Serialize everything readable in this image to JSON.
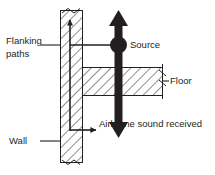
{
  "diagram": {
    "type": "architectural-section",
    "background_color": "#ffffff",
    "ink_color": "#231f20",
    "labels": {
      "flanking_paths_line1": "Flanking",
      "flanking_paths_line2": "paths",
      "source": "Source",
      "floor": "Floor",
      "airborne": "Airborne sound received",
      "wall": "Wall"
    },
    "elements": {
      "wall": {
        "name": "Wall",
        "hatch": "diagonal",
        "orientation": "vertical",
        "break_symbol_top": true,
        "break_symbol_bottom": true
      },
      "floor": {
        "name": "Floor",
        "hatch": "diagonal",
        "orientation": "horizontal",
        "break_symbol_right": true
      },
      "source": {
        "name": "Source",
        "marker": "filled-circle",
        "color": "#231f20"
      },
      "sound_arrow": {
        "name": "Airborne sound path",
        "style": "thick-double-headed-vertical-arrow",
        "color": "#231f20"
      },
      "flanking_arrow_vertical": {
        "name": "Flanking path in wall",
        "style": "thin-arrow-up",
        "color": "#231f20"
      },
      "flanking_arrow_horizontal": {
        "name": "Flanking path out of wall",
        "style": "thin-arrow-right",
        "color": "#231f20"
      },
      "source_leader": {
        "name": "Source to wall connector",
        "style": "thin-horizontal-line"
      }
    }
  }
}
